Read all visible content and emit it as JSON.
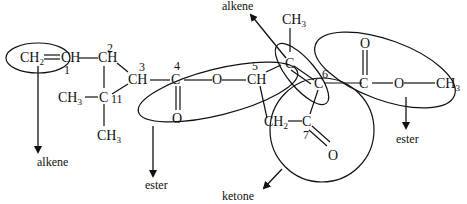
{
  "diagram": {
    "atoms": {
      "ch2_terminal": "CH",
      "ch_1": "CH",
      "ch_2": "CH",
      "ch_3": "CH",
      "c_4": "C",
      "o_4_carbonyl": "O",
      "o_ester1": "O",
      "ch_5": "CH",
      "c_alkene_top": "C",
      "ch3_top": "CH",
      "c_6": "C",
      "c_ester2": "C",
      "o_ester2_carbonyl": "O",
      "o_ester2": "O",
      "ch3_ester2": "CH",
      "ch2_ring": "CH",
      "c_7": "C",
      "o_7": "O",
      "ch3_left": "CH",
      "c_11": "C",
      "ch3_bottom": "CH"
    },
    "subscripts": {
      "two": "2",
      "three": "3"
    },
    "numbers": [
      "1",
      "2",
      "3",
      "4",
      "5",
      "6",
      "7",
      "11"
    ],
    "labels": {
      "alkene_left": "alkene",
      "alkene_top": "alkene",
      "ester_left": "ester",
      "ester_right": "ester",
      "ketone": "ketone"
    },
    "functional_groups": [
      {
        "name": "alkene",
        "atoms": "CH2=CH"
      },
      {
        "name": "ester",
        "atoms": "C(=O)-O"
      },
      {
        "name": "alkene",
        "atoms": "C=C"
      },
      {
        "name": "ester",
        "atoms": "C(=O)-O-CH3"
      },
      {
        "name": "ketone",
        "atoms": "C=O (C7)"
      }
    ]
  }
}
